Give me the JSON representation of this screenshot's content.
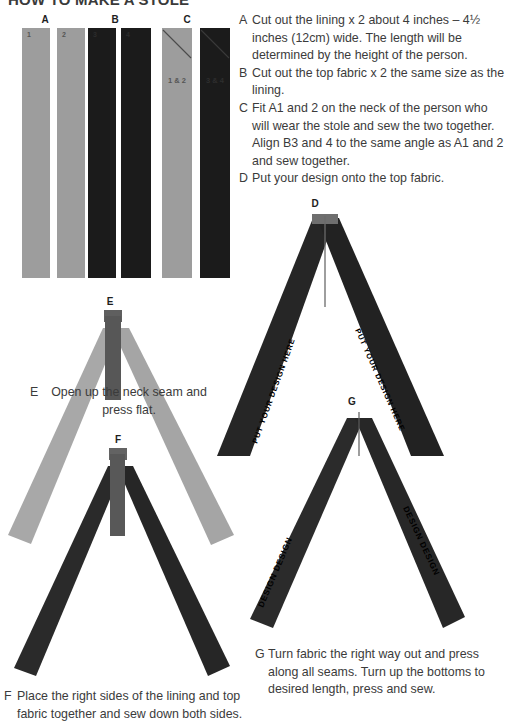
{
  "document": {
    "title": "HOW TO MAKE A STOLE"
  },
  "palette": {
    "lining_fabric": "#9d9d9d",
    "top_fabric": "#1b1b1b",
    "seam": "#6f6f6f",
    "text": "#3b3b3b",
    "background": "#ffffff"
  },
  "groups": [
    {
      "id": "A",
      "label": "A"
    },
    {
      "id": "B",
      "label": "B"
    },
    {
      "id": "C",
      "label": "C"
    }
  ],
  "strips": [
    {
      "group": "A",
      "tone": "light",
      "number": "1"
    },
    {
      "group": "A",
      "tone": "light",
      "number": "2"
    },
    {
      "group": "B",
      "tone": "dark",
      "number": "3"
    },
    {
      "group": "B",
      "tone": "dark",
      "number": "4"
    },
    {
      "group": "C",
      "tone": "light",
      "number": "1 & 2"
    },
    {
      "group": "C",
      "tone": "dark",
      "number": "3 & 4"
    }
  ],
  "instructions": [
    {
      "key": "A",
      "text": "Cut out the lining x 2 about 4 inches – 4½ inches (12cm) wide. The length will be determined by the height of the person."
    },
    {
      "key": "B",
      "text": "Cut out the top fabric x 2 the same size as the lining."
    },
    {
      "key": "C",
      "text": "Fit A1 and 2 on the neck of the person who will wear the stole and sew the two together. Align B3 and 4 to the same angle as A1 and 2 and sew together."
    },
    {
      "key": "D",
      "text": "Put your design onto the top fabric."
    }
  ],
  "diagrams": {
    "d": {
      "label": "D",
      "arm_text": "PUT YOUR DESIGN HERE",
      "tone": "dark"
    },
    "e": {
      "label": "E",
      "tone": "light",
      "caption_key": "E",
      "caption_text": "Open up the neck seam and press flat."
    },
    "f": {
      "label": "F",
      "tone": "dark",
      "caption_key": "F",
      "caption_text": "Place the right sides of the lining and top fabric together and sew down both sides."
    },
    "g": {
      "label": "G",
      "arm_text": "DESIGN DESIGN",
      "tone": "dark",
      "caption_key": "G",
      "caption_text": "Turn fabric the right way out and press along all seams. Turn up the bottoms to desired length, press and sew."
    }
  }
}
